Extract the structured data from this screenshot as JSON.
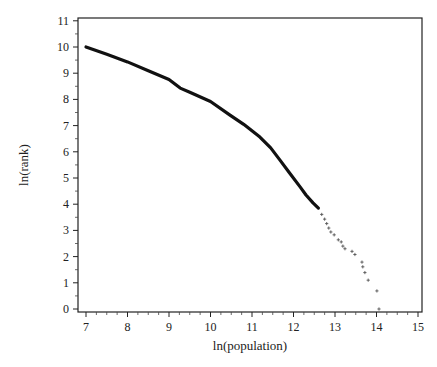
{
  "chart_data": {
    "type": "scatter",
    "title": "",
    "xlabel": "ln(population)",
    "ylabel": "ln(rank)",
    "xlim": [
      7,
      15
    ],
    "ylim": [
      0,
      11
    ],
    "xticks": [
      7,
      8,
      9,
      10,
      11,
      12,
      13,
      14,
      15
    ],
    "yticks": [
      0,
      1,
      2,
      3,
      4,
      5,
      6,
      7,
      8,
      9,
      10,
      11
    ],
    "grid": false,
    "legend": null,
    "series": [
      {
        "name": "dense curve",
        "style": "thick-line",
        "color": "#111111",
        "x": [
          7.0,
          7.5,
          8.0,
          8.5,
          9.0,
          9.27,
          9.5,
          10.0,
          10.47,
          10.8,
          11.19,
          11.45,
          11.67,
          11.9,
          12.16,
          12.3,
          12.47,
          12.6
        ],
        "y": [
          10.0,
          9.72,
          9.43,
          9.09,
          8.76,
          8.43,
          8.27,
          7.92,
          7.4,
          7.05,
          6.56,
          6.15,
          5.69,
          5.2,
          4.66,
          4.35,
          4.05,
          3.85
        ]
      },
      {
        "name": "tail points",
        "style": "plus-markers",
        "color": "#555555",
        "x": [
          12.68,
          12.75,
          12.8,
          12.85,
          12.9,
          12.98,
          13.08,
          13.15,
          13.19,
          13.24,
          13.41,
          13.48,
          13.65,
          13.67,
          13.72,
          13.8,
          14.01,
          14.06
        ],
        "y": [
          3.61,
          3.43,
          3.26,
          3.09,
          2.94,
          2.83,
          2.64,
          2.56,
          2.4,
          2.3,
          2.2,
          2.08,
          1.79,
          1.61,
          1.39,
          1.1,
          0.69,
          0.0
        ]
      }
    ]
  }
}
